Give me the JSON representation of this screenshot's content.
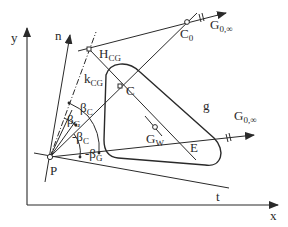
{
  "axes": {
    "x_label": "x",
    "y_label": "y",
    "n_label": "n",
    "t_label": "t",
    "g_label": "g"
  },
  "points": {
    "P": "P",
    "C": "C",
    "C0": {
      "main": "C",
      "sub": "0"
    },
    "HCG": {
      "main": "H",
      "sub": "CG"
    },
    "GW": {
      "main": "G",
      "sub": "W"
    },
    "region": "E"
  },
  "lines": {
    "kCG": {
      "main": "k",
      "sub": "CG"
    },
    "G0inf_top": {
      "main": "G",
      "sub": "0,∞"
    },
    "G0inf_g": {
      "main": "G",
      "sub": "0,∞"
    }
  },
  "angles": {
    "beta_C": {
      "main": "β",
      "sub": "C"
    },
    "beta_G": {
      "main": "β",
      "sub": "G"
    },
    "neg_beta_C": {
      "main": "-β",
      "sub": "C"
    },
    "neg_beta_G": {
      "main": "-β",
      "sub": "G"
    }
  },
  "colors": {
    "stroke": "#2a2a2a",
    "background": "#ffffff"
  }
}
